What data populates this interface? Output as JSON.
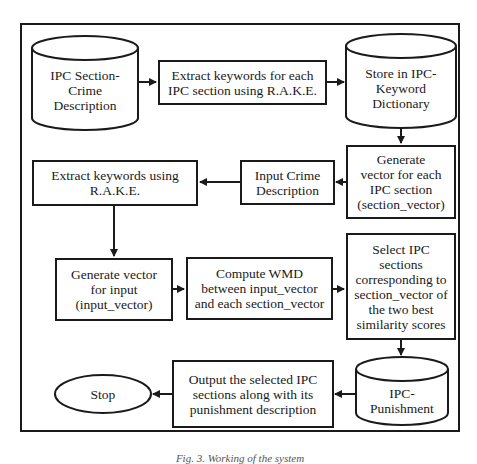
{
  "diagram": {
    "type": "flowchart",
    "nodes": [
      {
        "id": "ipc_crime_db",
        "shape": "cylinder",
        "label": "IPC Section-\nCrime\nDescription"
      },
      {
        "id": "extract_each",
        "shape": "rect",
        "label": "Extract keywords for each\nIPC section using R.A.K.E."
      },
      {
        "id": "keyword_dict",
        "shape": "cylinder",
        "label": "Store in IPC-\nKeyword\nDictionary"
      },
      {
        "id": "gen_section_vec",
        "shape": "rect",
        "label": "Generate\nvector for each\nIPC section\n(section_vector)"
      },
      {
        "id": "input_crime",
        "shape": "rect",
        "label": "Input Crime\nDescription"
      },
      {
        "id": "extract_input",
        "shape": "rect",
        "label": "Extract keywords using\nR.A.K.E."
      },
      {
        "id": "gen_input_vec",
        "shape": "rect",
        "label": "Generate vector\nfor input\n(input_vector)"
      },
      {
        "id": "compute_wmd",
        "shape": "rect",
        "label": "Compute WMD\nbetween input_vector\nand each section_vector"
      },
      {
        "id": "select_ipc",
        "shape": "rect",
        "label": "Select IPC\nsections\ncorresponding to\nsection_vector of\nthe two best\nsimilarity scores"
      },
      {
        "id": "ipc_punishment",
        "shape": "cylinder",
        "label": "IPC-\nPunishment"
      },
      {
        "id": "output",
        "shape": "rect",
        "label": "Output the selected IPC\nsections along with its\npunishment description"
      },
      {
        "id": "stop",
        "shape": "ellipse",
        "label": "Stop"
      }
    ],
    "edges": [
      {
        "from": "ipc_crime_db",
        "to": "extract_each"
      },
      {
        "from": "extract_each",
        "to": "keyword_dict"
      },
      {
        "from": "keyword_dict",
        "to": "gen_section_vec"
      },
      {
        "from": "gen_section_vec",
        "to": "input_crime"
      },
      {
        "from": "input_crime",
        "to": "extract_input"
      },
      {
        "from": "extract_input",
        "to": "gen_input_vec"
      },
      {
        "from": "gen_input_vec",
        "to": "compute_wmd"
      },
      {
        "from": "compute_wmd",
        "to": "select_ipc"
      },
      {
        "from": "select_ipc",
        "to": "ipc_punishment"
      },
      {
        "from": "ipc_punishment",
        "to": "output"
      },
      {
        "from": "output",
        "to": "stop"
      }
    ],
    "caption": "Fig. 3. Working of the system"
  },
  "colors": {
    "stroke": "#1a1a1a",
    "fill": "#ffffff"
  }
}
